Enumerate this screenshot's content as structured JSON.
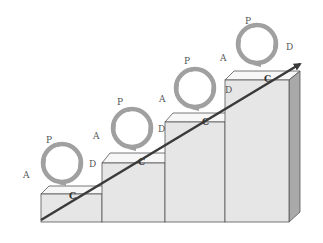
{
  "diagram": {
    "type": "staircase-pdca",
    "colors": {
      "background": "#ffffff",
      "block_front": "#e6e6e6",
      "block_top": "#f7f7f7",
      "block_side": "#a9a9a9",
      "block_edge": "#555555",
      "cycle_ring": "#a0a0a0",
      "arrow": "#3a3a3a",
      "label": "#555555"
    },
    "steps": [
      {
        "index": 1,
        "labels": {
          "plan": "P",
          "do": "D",
          "check": "C",
          "act": "A"
        }
      },
      {
        "index": 2,
        "labels": {
          "plan": "P",
          "do": "D",
          "check": "C",
          "act": "A"
        }
      },
      {
        "index": 3,
        "labels": {
          "plan": "P",
          "do": "D",
          "check": "C",
          "act": "A"
        }
      },
      {
        "index": 4,
        "labels": {
          "plan": "P",
          "do": "D",
          "check": "C",
          "act": "A"
        }
      }
    ],
    "arrow": {
      "direction": "up-right",
      "meaning": "continuous-improvement"
    }
  }
}
